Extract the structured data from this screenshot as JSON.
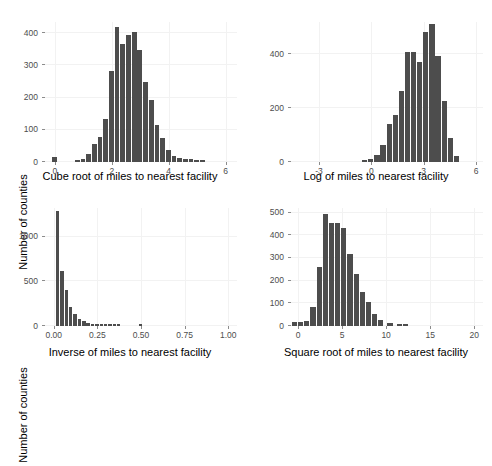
{
  "figure": {
    "panel_count": 4,
    "bar_color": "#4d4d4d",
    "grid_color": "#f2f2f2",
    "background": "#ffffff",
    "tick_label_color": "#4d4d4d"
  },
  "chart_data": [
    {
      "type": "bar",
      "id": "cube-root",
      "title": "",
      "xlabel": "Cube root of miles to nearest facility",
      "ylabel": "Number of counties",
      "xlim": [
        -0.35,
        6.4
      ],
      "ylim": [
        0,
        435
      ],
      "xticks": [
        0,
        2,
        4,
        6
      ],
      "xtick_labels": [
        "0",
        "2",
        "4",
        "6"
      ],
      "yticks": [
        0,
        100,
        200,
        300,
        400
      ],
      "ytick_labels": [
        "0",
        "100",
        "200",
        "300",
        "400"
      ],
      "grid": true,
      "bin_width": 0.2,
      "x": [
        0.0,
        0.8,
        1.0,
        1.2,
        1.4,
        1.6,
        1.8,
        2.0,
        2.2,
        2.4,
        2.6,
        2.8,
        3.0,
        3.2,
        3.4,
        3.6,
        3.8,
        4.0,
        4.2,
        4.4,
        4.6,
        4.8,
        5.0,
        5.2
      ],
      "values": [
        16,
        4,
        10,
        24,
        55,
        78,
        134,
        282,
        418,
        366,
        395,
        404,
        348,
        249,
        194,
        114,
        74,
        36,
        18,
        14,
        10,
        8,
        5,
        3
      ]
    },
    {
      "type": "bar",
      "id": "log",
      "title": "",
      "xlabel": "Log of miles to nearest facility",
      "ylabel": "",
      "xlim": [
        -4.6,
        6.4
      ],
      "ylim": [
        0,
        520
      ],
      "xticks": [
        -3,
        0,
        3,
        6
      ],
      "xtick_labels": [
        "-3",
        "0",
        "3",
        "6"
      ],
      "yticks": [
        0,
        200,
        400
      ],
      "ytick_labels": [
        "0",
        "200",
        "400"
      ],
      "grid": true,
      "bin_width": 0.35,
      "x": [
        -0.35,
        0.0,
        0.35,
        0.7,
        1.05,
        1.4,
        1.75,
        2.1,
        2.45,
        2.8,
        3.15,
        3.5,
        3.85,
        4.2,
        4.55,
        4.9
      ],
      "values": [
        6,
        10,
        26,
        63,
        140,
        175,
        262,
        410,
        409,
        370,
        482,
        513,
        392,
        228,
        90,
        22
      ]
    },
    {
      "type": "bar",
      "id": "inverse",
      "title": "",
      "xlabel": "Inverse of miles to nearest facility",
      "ylabel": "Number of counties",
      "xlim": [
        -0.05,
        1.05
      ],
      "ylim": [
        0,
        1320
      ],
      "xticks": [
        0.0,
        0.25,
        0.5,
        0.75,
        1.0
      ],
      "xtick_labels": [
        "0.00",
        "0.25",
        "0.50",
        "0.75",
        "1.00"
      ],
      "yticks": [
        0,
        500,
        1000
      ],
      "ytick_labels": [
        "0",
        "500",
        "1000"
      ],
      "grid": true,
      "bin_width": 0.025,
      "x": [
        0.025,
        0.05,
        0.075,
        0.1,
        0.125,
        0.15,
        0.175,
        0.2,
        0.225,
        0.25,
        0.275,
        0.3,
        0.325,
        0.35,
        0.375,
        0.5
      ],
      "values": [
        1290,
        620,
        400,
        215,
        130,
        80,
        52,
        30,
        22,
        14,
        10,
        8,
        6,
        5,
        4,
        8
      ]
    },
    {
      "type": "bar",
      "id": "square-root",
      "title": "",
      "xlabel": "Square root of miles to nearest facility",
      "ylabel": "",
      "xlim": [
        -0.8,
        21
      ],
      "ylim": [
        0,
        520
      ],
      "xticks": [
        0,
        5,
        10,
        15,
        20
      ],
      "xtick_labels": [
        "0",
        "5",
        "10",
        "15",
        "20"
      ],
      "yticks": [
        0,
        100,
        200,
        300,
        400,
        500
      ],
      "ytick_labels": [
        "0",
        "100",
        "200",
        "300",
        "400",
        "500"
      ],
      "grid": true,
      "bin_width": 0.7,
      "x": [
        -0.35,
        0.35,
        1.05,
        1.75,
        2.45,
        3.15,
        3.85,
        4.55,
        5.25,
        5.95,
        6.65,
        7.35,
        8.05,
        8.75,
        9.45,
        10.5,
        11.55,
        12.25
      ],
      "values": [
        18,
        18,
        22,
        82,
        258,
        492,
        452,
        452,
        432,
        318,
        228,
        150,
        105,
        54,
        26,
        12,
        4,
        4
      ]
    }
  ]
}
